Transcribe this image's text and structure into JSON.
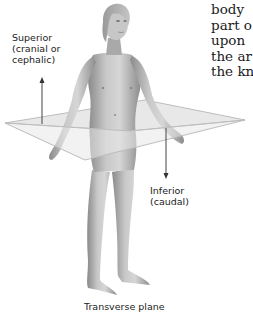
{
  "diagram": {
    "caption": "Transverse plane",
    "labels": {
      "superior": [
        "Superior",
        "(cranial or",
        "cephalic)"
      ],
      "inferior": [
        "Inferior",
        "(caudal)"
      ]
    },
    "arrows": [
      {
        "name": "superior-arrow",
        "direction": "up"
      },
      {
        "name": "inferior-arrow",
        "direction": "down"
      }
    ],
    "plane": {
      "name": "transverse-plane",
      "color": "#c8c8c8"
    }
  },
  "side_text": {
    "lines": [
      "body",
      "part o",
      "upon",
      "the ar",
      "the kn"
    ]
  }
}
